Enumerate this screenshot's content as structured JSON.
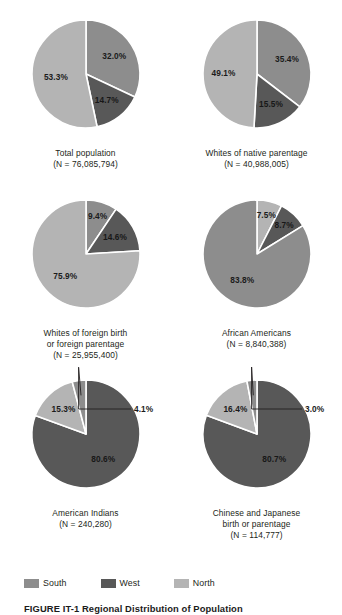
{
  "figure": {
    "caption": "FIGURE IT-1  Regional Distribution of Population"
  },
  "colors": {
    "south": "#8d8d8d",
    "west": "#585858",
    "north": "#b4b4b4",
    "separator": "#ffffff",
    "text": "#231f20"
  },
  "legend": {
    "items": [
      {
        "label": "South",
        "color": "#8d8d8d",
        "key": "south"
      },
      {
        "label": "West",
        "color": "#585858",
        "key": "west"
      },
      {
        "label": "North",
        "color": "#b4b4b4",
        "key": "north"
      }
    ]
  },
  "chart_data": {
    "type": "pie",
    "title": "FIGURE IT-1  Regional Distribution of Population",
    "legend_position": "bottom-left",
    "categories": [
      "South",
      "West",
      "North"
    ],
    "category_colors": [
      "#8d8d8d",
      "#585858",
      "#b4b4b4"
    ],
    "charts": [
      {
        "id": "total-population",
        "title_lines": [
          "Total population",
          "(N = 76,085,794)"
        ],
        "title": "Total population",
        "n_label": "(N = 76,085,794)",
        "n": 76085794,
        "slices": [
          {
            "name": "South",
            "value": 32.0,
            "label": "32.0%",
            "color": "#8d8d8d"
          },
          {
            "name": "West",
            "value": 14.7,
            "label": "14.7%",
            "color": "#585858"
          },
          {
            "name": "North",
            "value": 53.3,
            "label": "53.3%",
            "color": "#b4b4b4"
          }
        ]
      },
      {
        "id": "whites-native-parentage",
        "title_lines": [
          "Whites of native parentage",
          "(N = 40,988,005)"
        ],
        "title": "Whites of native parentage",
        "n_label": "(N = 40,988,005)",
        "n": 40988005,
        "slices": [
          {
            "name": "South",
            "value": 35.4,
            "label": "35.4%",
            "color": "#8d8d8d"
          },
          {
            "name": "West",
            "value": 15.5,
            "label": "15.5%",
            "color": "#585858"
          },
          {
            "name": "North",
            "value": 49.1,
            "label": "49.1%",
            "color": "#b4b4b4"
          }
        ]
      },
      {
        "id": "whites-foreign-birth",
        "title_lines": [
          "Whites of foreign birth",
          "or foreign parentage",
          "(N = 25,955,400)"
        ],
        "title": "Whites of foreign birth or foreign parentage",
        "n_label": "(N = 25,955,400)",
        "n": 25955400,
        "slices": [
          {
            "name": "South",
            "value": 9.4,
            "label": "9.4%",
            "color": "#8d8d8d"
          },
          {
            "name": "West",
            "value": 14.6,
            "label": "14.6%",
            "color": "#585858"
          },
          {
            "name": "North",
            "value": 75.9,
            "label": "75.9%",
            "color": "#b4b4b4"
          }
        ]
      },
      {
        "id": "african-americans",
        "title_lines": [
          "African Americans",
          "(N = 8,840,388)"
        ],
        "title": "African Americans",
        "n_label": "(N = 8,840,388)",
        "n": 8840388,
        "slices": [
          {
            "name": "South",
            "value": 83.8,
            "label": "83.8%",
            "color": "#8d8d8d"
          },
          {
            "name": "West",
            "value": 8.7,
            "label": "8.7%",
            "color": "#585858"
          },
          {
            "name": "North",
            "value": 7.5,
            "label": "7.5%",
            "color": "#b4b4b4"
          }
        ]
      },
      {
        "id": "american-indians",
        "title_lines": [
          "American Indians",
          "(N = 240,280)"
        ],
        "title": "American Indians",
        "n_label": "(N = 240,280)",
        "n": 240280,
        "slices": [
          {
            "name": "South",
            "value": 4.1,
            "label": "4.1%",
            "color": "#8d8d8d"
          },
          {
            "name": "West",
            "value": 80.6,
            "label": "80.6%",
            "color": "#585858"
          },
          {
            "name": "North",
            "value": 15.3,
            "label": "15.3%",
            "color": "#b4b4b4"
          }
        ]
      },
      {
        "id": "chinese-japanese",
        "title_lines": [
          "Chinese and Japanese",
          "birth or parentage",
          "(N = 114,777)"
        ],
        "title": "Chinese and Japanese birth or parentage",
        "n_label": "(N = 114,777)",
        "n": 114777,
        "slices": [
          {
            "name": "South",
            "value": 3.0,
            "label": "3.0%",
            "color": "#8d8d8d"
          },
          {
            "name": "West",
            "value": 80.7,
            "label": "80.7%",
            "color": "#585858"
          },
          {
            "name": "North",
            "value": 16.4,
            "label": "16.4%",
            "color": "#b4b4b4"
          }
        ]
      }
    ]
  }
}
